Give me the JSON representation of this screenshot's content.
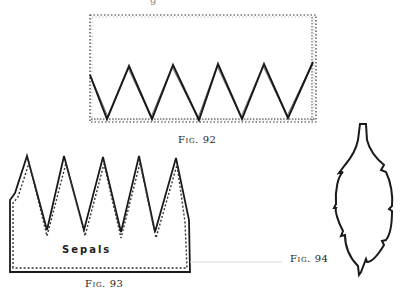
{
  "figures": [
    {
      "id": "fig92",
      "caption": "Fig. 92",
      "description": "Dotted rectangle with a solid zigzag line of five points along its lower portion",
      "rect": {
        "x": 90,
        "y": 15,
        "width": 226,
        "height": 107
      },
      "zigzag_points": [
        [
          90,
          75
        ],
        [
          107,
          119
        ],
        [
          129,
          66
        ],
        [
          152,
          119
        ],
        [
          173,
          65
        ],
        [
          199,
          120
        ],
        [
          218,
          64
        ],
        [
          242,
          119
        ],
        [
          264,
          64
        ],
        [
          288,
          118
        ],
        [
          313,
          62
        ]
      ]
    },
    {
      "id": "fig93",
      "caption": "Fig. 93",
      "label": "Sepals",
      "description": "Five-pointed crown shape with solid outline and inner dotted outline",
      "outline_points": [
        [
          10,
          272
        ],
        [
          10,
          200
        ],
        [
          15,
          193
        ],
        [
          27,
          156
        ],
        [
          47,
          230
        ],
        [
          64,
          156
        ],
        [
          84,
          230
        ],
        [
          103,
          157
        ],
        [
          121,
          232
        ],
        [
          139,
          156
        ],
        [
          155,
          232
        ],
        [
          176,
          158
        ],
        [
          189,
          220
        ],
        [
          190,
          272
        ]
      ]
    },
    {
      "id": "fig94",
      "caption": "Fig. 94",
      "description": "Leaf-shaped outline with short stem at top and serrated edges"
    }
  ],
  "top_fragment": "g",
  "colors": {
    "ink": "#1a1a1a",
    "dotted": "#333333",
    "faint_line": "#d8d8d8",
    "background": "#ffffff"
  }
}
